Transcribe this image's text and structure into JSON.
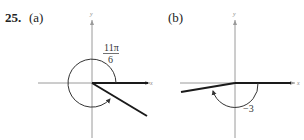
{
  "problem": {
    "number": "25.",
    "parts": [
      {
        "label": "(a)",
        "angle_label_numerator": "11π",
        "angle_label_denominator": "6",
        "axis_x": "x",
        "axis_y": "y",
        "direction": "counterclockwise"
      },
      {
        "label": "(b)",
        "angle_label": "−3",
        "axis_x": "x",
        "axis_y": "y",
        "direction": "clockwise"
      }
    ]
  },
  "colors": {
    "axis": "#9a9a9a",
    "terminal_side": "#1a1a1a",
    "arc": "#333333"
  }
}
